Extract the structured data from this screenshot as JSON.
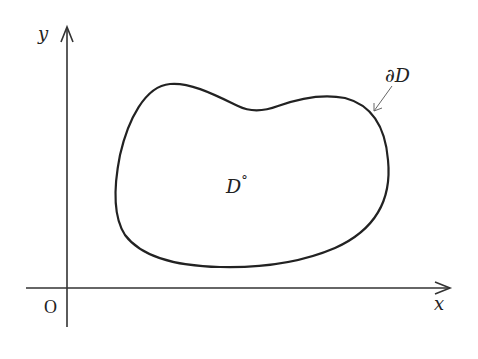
{
  "diagram": {
    "type": "planar-domain",
    "axes": {
      "x_label": "x",
      "y_label": "y",
      "origin_label": "O"
    },
    "region": {
      "interior_label": "D",
      "interior_superscript": "°",
      "boundary_label": "∂D"
    },
    "colors": {
      "stroke": "#222222",
      "arrow": "#555555",
      "background": "#ffffff"
    }
  }
}
